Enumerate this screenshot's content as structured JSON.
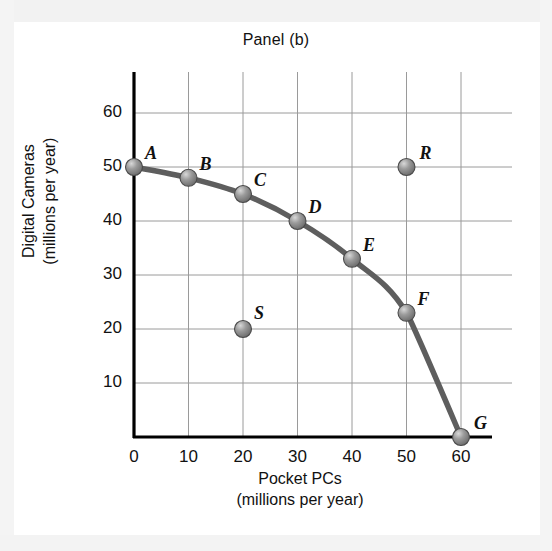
{
  "chart_data": {
    "type": "line",
    "title": "Panel (b)",
    "xlabel_line1": "Pocket PCs",
    "xlabel_line2": "(millions per year)",
    "ylabel_line1": "Digital Cameras",
    "ylabel_line2": "(millions per year)",
    "xlim": [
      0,
      60
    ],
    "ylim": [
      0,
      65
    ],
    "xticks": [
      "0",
      "10",
      "20",
      "30",
      "40",
      "50",
      "60"
    ],
    "xtick_values": [
      0,
      10,
      20,
      30,
      40,
      50,
      60
    ],
    "yticks": [
      "10",
      "20",
      "30",
      "40",
      "50",
      "60"
    ],
    "ytick_values": [
      10,
      20,
      30,
      40,
      50,
      60
    ],
    "grid": true,
    "legend": "none",
    "series": [
      {
        "name": "production-possibilities-frontier",
        "kind": "line-with-markers",
        "color": "#5e5e5e",
        "points": [
          {
            "label": "A",
            "x": 0,
            "y": 50
          },
          {
            "label": "B",
            "x": 10,
            "y": 48
          },
          {
            "label": "C",
            "x": 20,
            "y": 45
          },
          {
            "label": "D",
            "x": 30,
            "y": 40
          },
          {
            "label": "E",
            "x": 40,
            "y": 33
          },
          {
            "label": "F",
            "x": 50,
            "y": 23
          },
          {
            "label": "G",
            "x": 60,
            "y": 0
          }
        ]
      },
      {
        "name": "off-frontier-points",
        "kind": "markers-only",
        "color": "#6b6b6b",
        "points": [
          {
            "label": "R",
            "x": 50,
            "y": 50
          },
          {
            "label": "S",
            "x": 20,
            "y": 20
          }
        ]
      }
    ],
    "colors": {
      "axis": "#000000",
      "grid": "#9a9a9a",
      "curve": "#5e5e5e",
      "marker_fill": "#8c8c8c",
      "marker_edge": "#4a4a4a",
      "text": "#111111",
      "background": "#ffffff"
    }
  }
}
